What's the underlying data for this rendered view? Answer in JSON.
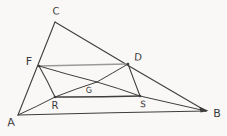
{
  "figure": {
    "kind": "hand-drawn geometry sketch",
    "paper_color": "#f9f8f6",
    "ink_color": "#3e3e3e",
    "pencil_color": "#9a9a9a",
    "points": {
      "A": {
        "x": 18,
        "y": 115
      },
      "B": {
        "x": 206,
        "y": 111
      },
      "C": {
        "x": 55,
        "y": 22
      },
      "F": {
        "x": 39,
        "y": 66
      },
      "D": {
        "x": 128,
        "y": 64
      },
      "G": {
        "x": 97,
        "y": 82
      },
      "R": {
        "x": 55,
        "y": 97
      },
      "S": {
        "x": 140,
        "y": 96
      }
    },
    "segments": [
      {
        "from": "A",
        "to": "C",
        "pen": "ink",
        "w": 1.1
      },
      {
        "from": "C",
        "to": "B",
        "pen": "ink",
        "w": 1.1
      },
      {
        "from": "A",
        "to": "B",
        "pen": "ink",
        "w": 1.1
      },
      {
        "from": "F",
        "to": "D",
        "pen": "pencil",
        "w": 1.6
      },
      {
        "from": "R",
        "to": "S",
        "pen": "ink",
        "w": 1.5
      },
      {
        "from": "F",
        "to": "R",
        "pen": "ink",
        "w": 1.1
      },
      {
        "from": "D",
        "to": "S",
        "pen": "ink",
        "w": 1.1
      },
      {
        "from": "A",
        "to": "R",
        "pen": "ink",
        "w": 1.0
      },
      {
        "from": "R",
        "to": "G",
        "pen": "ink",
        "w": 1.0
      },
      {
        "from": "G",
        "to": "D",
        "pen": "ink",
        "w": 1.0
      },
      {
        "from": "F",
        "to": "G",
        "pen": "ink",
        "w": 1.0
      },
      {
        "from": "G",
        "to": "S",
        "pen": "ink",
        "w": 1.0
      },
      {
        "from": "S",
        "to": "B",
        "pen": "ink",
        "w": 1.0
      }
    ],
    "labels": [
      {
        "text": "C",
        "x": 56,
        "y": 11,
        "size": 10
      },
      {
        "text": "F",
        "x": 29,
        "y": 61,
        "size": 11
      },
      {
        "text": "D",
        "x": 138,
        "y": 57,
        "size": 10
      },
      {
        "text": "G",
        "x": 89,
        "y": 90,
        "size": 8
      },
      {
        "text": "R",
        "x": 55,
        "y": 105,
        "size": 10
      },
      {
        "text": "S",
        "x": 143,
        "y": 104,
        "size": 9
      },
      {
        "text": "A",
        "x": 11,
        "y": 122,
        "size": 11
      },
      {
        "text": "B",
        "x": 217,
        "y": 113,
        "size": 11
      }
    ],
    "junction_dots": [
      "F",
      "D",
      "R",
      "S"
    ],
    "arrowhead": {
      "at": "B",
      "tip": {
        "x": 208.5,
        "y": 110.8
      },
      "wing1": {
        "x": 199.5,
        "y": 106.8
      },
      "wing2": {
        "x": 200.5,
        "y": 112.6
      }
    }
  }
}
